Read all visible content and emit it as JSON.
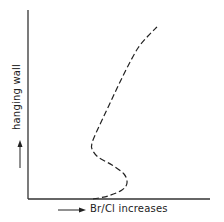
{
  "chart_data": {
    "type": "line",
    "title": "",
    "xlabel": "Br/Cl increases",
    "ylabel": "hanging wall",
    "x_axis_direction_arrow": "right",
    "y_axis_direction_arrow": "up",
    "ticks": {
      "x": [],
      "y": []
    },
    "grid": false,
    "legend": null,
    "series": [
      {
        "name": "Br/Cl profile",
        "style": "dashed",
        "color": "#222222",
        "points_px": [
          [
            93,
            199
          ],
          [
            108,
            196
          ],
          [
            122,
            190
          ],
          [
            127,
            183
          ],
          [
            124,
            174
          ],
          [
            112,
            165
          ],
          [
            98,
            157
          ],
          [
            92,
            149
          ],
          [
            92,
            143
          ],
          [
            96,
            133
          ],
          [
            103,
            118
          ],
          [
            111,
            101
          ],
          [
            119,
            84
          ],
          [
            128,
            66
          ],
          [
            138,
            48
          ],
          [
            148,
            36
          ],
          [
            157,
            27
          ]
        ]
      }
    ],
    "axes_px": {
      "origin": [
        28,
        199
      ],
      "x_end": [
        210,
        199
      ],
      "y_end": [
        28,
        10
      ]
    }
  },
  "labels": {
    "x": "Br/Cl increases",
    "y": "hanging wall"
  },
  "colors": {
    "ink": "#222222",
    "axis": "#333333",
    "background": "#ffffff"
  }
}
